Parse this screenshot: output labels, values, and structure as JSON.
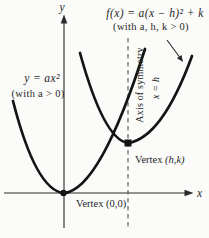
{
  "figure": {
    "colors": {
      "background": "#fbfbf9",
      "ink": "#2a2a2a",
      "curve": "#141414",
      "dashed": "#555555"
    },
    "axes": {
      "x_label": "x",
      "y_label": "y"
    },
    "shifted_parabola": {
      "formula": "f(x) = a(x − h)² + k",
      "condition": "(with a, h, k > 0)",
      "vertex_label_prefix": "Vertex ",
      "vertex_label_value": "(h,k)"
    },
    "basic_parabola": {
      "formula": "y = ax²",
      "condition": "(with a > 0)",
      "vertex_label_prefix": "Vertex ",
      "vertex_label_value": "(0,0)"
    },
    "axis_of_symmetry": {
      "label": "Axis of symmetry",
      "equation": "x = h"
    }
  }
}
